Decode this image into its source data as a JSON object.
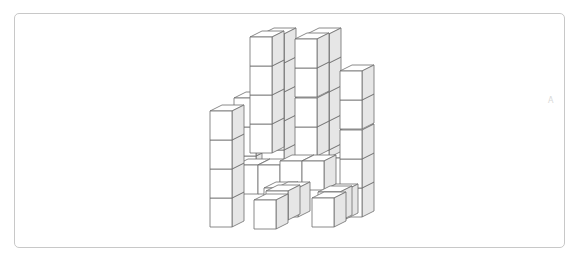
{
  "figure": {
    "type": "isometric-cube-stack",
    "cube": {
      "w": 22,
      "h": 29,
      "dx": 12,
      "dy": -6
    },
    "colors": {
      "front": "#ffffff",
      "top": "#ffffff",
      "side": "#e6e6e6",
      "stroke": "#6d6d6d",
      "frame": "#c8c8c8"
    },
    "cubes": [
      {
        "x": 234,
        "y": 156
      },
      {
        "x": 234,
        "y": 127
      },
      {
        "x": 234,
        "y": 98
      },
      {
        "x": 262,
        "y": 150
      },
      {
        "x": 262,
        "y": 121
      },
      {
        "x": 262,
        "y": 92
      },
      {
        "x": 262,
        "y": 63
      },
      {
        "x": 262,
        "y": 34
      },
      {
        "x": 307,
        "y": 150
      },
      {
        "x": 307,
        "y": 121
      },
      {
        "x": 307,
        "y": 92
      },
      {
        "x": 307,
        "y": 63
      },
      {
        "x": 307,
        "y": 34
      },
      {
        "x": 250,
        "y": 124
      },
      {
        "x": 250,
        "y": 95
      },
      {
        "x": 250,
        "y": 66
      },
      {
        "x": 250,
        "y": 37
      },
      {
        "x": 295,
        "y": 127
      },
      {
        "x": 295,
        "y": 98
      },
      {
        "x": 295,
        "y": 68
      },
      {
        "x": 295,
        "y": 39
      },
      {
        "x": 328,
        "y": 158
      },
      {
        "x": 340,
        "y": 188
      },
      {
        "x": 340,
        "y": 159
      },
      {
        "x": 340,
        "y": 130
      },
      {
        "x": 340,
        "y": 100
      },
      {
        "x": 340,
        "y": 71
      },
      {
        "x": 236,
        "y": 165
      },
      {
        "x": 258,
        "y": 165
      },
      {
        "x": 280,
        "y": 161
      },
      {
        "x": 302,
        "y": 161
      },
      {
        "x": 264,
        "y": 188
      },
      {
        "x": 276,
        "y": 188
      },
      {
        "x": 210,
        "y": 198
      },
      {
        "x": 210,
        "y": 169
      },
      {
        "x": 210,
        "y": 140
      },
      {
        "x": 210,
        "y": 111
      },
      {
        "x": 266,
        "y": 191
      },
      {
        "x": 324,
        "y": 190
      },
      {
        "x": 318,
        "y": 192
      },
      {
        "x": 254,
        "y": 200
      },
      {
        "x": 312,
        "y": 198
      }
    ]
  },
  "mark": "A"
}
